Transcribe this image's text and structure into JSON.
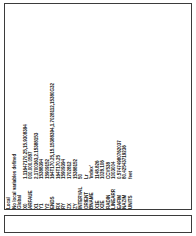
{
  "window": {
    "orientation": "rotated-90-ccw"
  },
  "listing": {
    "header_lines": [
      "Local",
      "No local variables defined",
      "Global"
    ],
    "rows": [
      {
        "name": "X0",
        "value": "1.11647170.25,15.9308394"
      },
      {
        "name": "ARFAUE",
        "value": "000.000.0587"
      },
      {
        "name": "X1",
        "value": "2.1700363,2.15388153"
      },
      {
        "name": "Y1",
        "value": "15388394"
      },
      {
        "name": "Y2",
        "value": "15909152"
      },
      {
        "name": "ENDS",
        "value": "164T170.25,15.15388394,1.7028112,15380G32"
      },
      {
        "name": "RX",
        "value": "164T170.25"
      },
      {
        "name": "RY",
        "value": "15909394"
      },
      {
        "name": "ZX",
        "value": "1702812"
      },
      {
        "name": "ZY",
        "value": "15388152"
      },
      {
        "name": "INTERVAL",
        "value": "50"
      },
      {
        "name": "ORIENT",
        "value": "Lr"
      },
      {
        "name": "BNAME",
        "value": "'index'"
      },
      {
        "name": "X1E",
        "value": "1148.826"
      },
      {
        "name": "X2E",
        "value": "1028.106"
      },
      {
        "name": "RADIN",
        "value": "CCV538"
      },
      {
        "name": "LINEARR",
        "value": "1003004"
      },
      {
        "name": "EAFIM",
        "value": "0.57474980762037"
      },
      {
        "name": "NAZIM",
        "value": "80.42543719236"
      },
      {
        "name": "UNITS",
        "value": "feet"
      }
    ]
  }
}
